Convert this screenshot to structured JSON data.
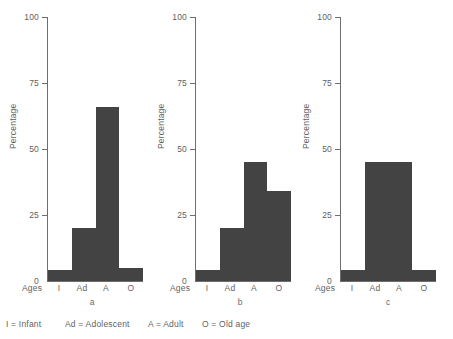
{
  "chart_data": [
    {
      "type": "bar",
      "panel_label": "a",
      "categories": [
        "I",
        "Ad",
        "A",
        "O"
      ],
      "values": [
        4,
        20,
        66,
        5
      ],
      "title": "",
      "xlabel": "Ages",
      "ylabel": "Percentage",
      "ylim": [
        0,
        100
      ],
      "yticks": [
        0,
        25,
        50,
        75,
        100
      ],
      "grid": false,
      "bar_color": "#434343",
      "contiguous_bars": true
    },
    {
      "type": "bar",
      "panel_label": "b",
      "categories": [
        "I",
        "Ad",
        "A",
        "O"
      ],
      "values": [
        4,
        20,
        45,
        34
      ],
      "title": "",
      "xlabel": "Ages",
      "ylabel": "Percentage",
      "ylim": [
        0,
        100
      ],
      "yticks": [
        0,
        25,
        50,
        75,
        100
      ],
      "grid": false,
      "bar_color": "#434343",
      "contiguous_bars": true
    },
    {
      "type": "bar",
      "panel_label": "c",
      "categories": [
        "I",
        "Ad",
        "A",
        "O"
      ],
      "values": [
        4,
        45,
        45,
        4
      ],
      "title": "",
      "xlabel": "Ages",
      "ylabel": "Percentage",
      "ylim": [
        0,
        100
      ],
      "yticks": [
        0,
        25,
        50,
        75,
        100
      ],
      "grid": false,
      "bar_color": "#434343",
      "contiguous_bars": true
    }
  ],
  "axis": {
    "y_title": "Percentage",
    "x_title": "Ages",
    "y_tick_labels": [
      "100",
      "75",
      "50",
      "25",
      "0"
    ],
    "x_tick_labels": [
      "I",
      "Ad",
      "A",
      "O"
    ]
  },
  "panels": {
    "a": {
      "caption": "a"
    },
    "b": {
      "caption": "b"
    },
    "c": {
      "caption": "c"
    }
  },
  "legend": {
    "entries": [
      "I = Infant",
      "Ad = Adolescent",
      "A = Adult",
      "O = Old age"
    ]
  },
  "colors": {
    "background": "#ffffff",
    "bar": "#434343",
    "axis": "#6e6e6e",
    "text": "#5f5f5f"
  }
}
